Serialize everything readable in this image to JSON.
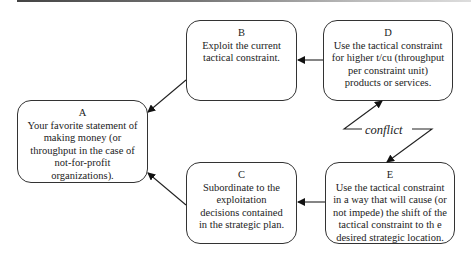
{
  "diagram": {
    "type": "flow",
    "nodes": [
      {
        "id": "A",
        "letter": "A",
        "text": "Your favorite statement of making money (or throughput in the case of not-for-profit organizations)."
      },
      {
        "id": "B",
        "letter": "B",
        "text": "Exploit the current tactical constraint."
      },
      {
        "id": "C",
        "letter": "C",
        "text": "Subordinate to the exploitation decisions contained in the strategic plan."
      },
      {
        "id": "D",
        "letter": "D",
        "text": "Use the tactical constraint for higher t/cu (throughput per constraint unit) products or services."
      },
      {
        "id": "E",
        "letter": "E",
        "text": "Use the tactical constraint in a way that will cause (or not impede) the shift of the tactical constraint to th e desired strategic location."
      }
    ],
    "edges": [
      {
        "from": "B",
        "to": "A"
      },
      {
        "from": "C",
        "to": "A"
      },
      {
        "from": "D",
        "to": "B"
      },
      {
        "from": "E",
        "to": "C"
      }
    ],
    "conflict": {
      "label": "conflict",
      "between": [
        "D",
        "E"
      ]
    }
  }
}
